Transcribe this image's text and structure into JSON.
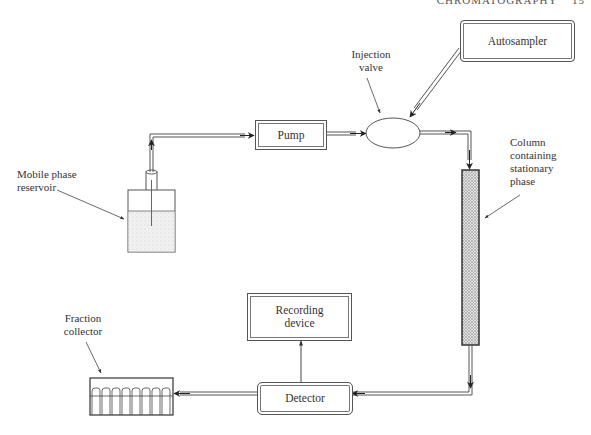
{
  "page_header": {
    "running_title": "CHROMATOGRAPHY",
    "page_number": "15"
  },
  "diagram": {
    "components": {
      "mobile_phase_reservoir": {
        "label": "Mobile phase\nreservoir",
        "label_line1": "Mobile phase",
        "label_line2": "reservoir"
      },
      "pump": {
        "label": "Pump"
      },
      "injection_valve": {
        "label_line1": "Injection",
        "label_line2": "valve"
      },
      "autosampler": {
        "label": "Autosampler"
      },
      "column": {
        "label_line1": "Column",
        "label_line2": "containing",
        "label_line3": "stationary",
        "label_line4": "phase"
      },
      "detector": {
        "label": "Detector"
      },
      "recording_device": {
        "label_line1": "Recording",
        "label_line2": "device"
      },
      "fraction_collector": {
        "label_line1": "Fraction",
        "label_line2": "collector",
        "tube_count": 8
      }
    },
    "flow": [
      "Mobile phase reservoir -> Pump",
      "Pump -> Injection valve",
      "Autosampler -> Injection valve",
      "Injection valve -> Column containing stationary phase",
      "Column -> Detector",
      "Detector -> Recording device",
      "Detector -> Fraction collector"
    ]
  }
}
